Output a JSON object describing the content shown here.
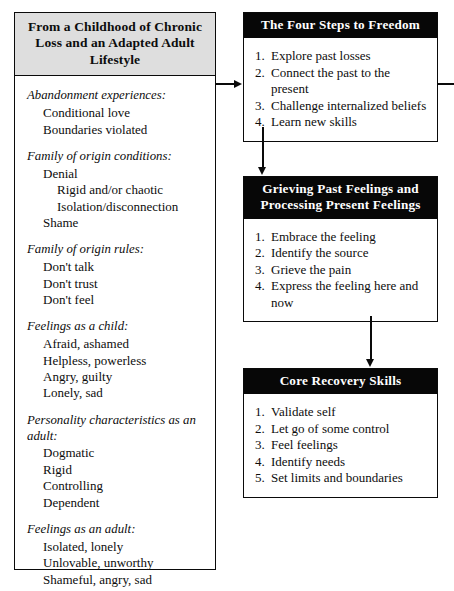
{
  "left_column": {
    "header": "From a Childhood of Chronic Loss and an Adapted Adult Lifestyle",
    "groups": [
      {
        "title": "Abandonment experiences:",
        "items": [
          {
            "text": "Conditional love",
            "level": 1
          },
          {
            "text": "Boundaries violated",
            "level": 1
          }
        ]
      },
      {
        "title": "Family of origin conditions:",
        "items": [
          {
            "text": "Denial",
            "level": 1
          },
          {
            "text": "Rigid and/or chaotic",
            "level": 2
          },
          {
            "text": "Isolation/disconnection",
            "level": 2
          },
          {
            "text": "Shame",
            "level": 1
          }
        ]
      },
      {
        "title": "Family of origin rules:",
        "items": [
          {
            "text": "Don't talk",
            "level": 1
          },
          {
            "text": "Don't trust",
            "level": 1
          },
          {
            "text": "Don't feel",
            "level": 1
          }
        ]
      },
      {
        "title": "Feelings as a child:",
        "items": [
          {
            "text": "Afraid, ashamed",
            "level": 1
          },
          {
            "text": "Helpless, powerless",
            "level": 1
          },
          {
            "text": "Angry, guilty",
            "level": 1
          },
          {
            "text": "Lonely, sad",
            "level": 1
          }
        ]
      },
      {
        "title": "Personality characteristics as an adult:",
        "items": [
          {
            "text": "Dogmatic",
            "level": 1
          },
          {
            "text": "Rigid",
            "level": 1
          },
          {
            "text": "Controlling",
            "level": 1
          },
          {
            "text": "Dependent",
            "level": 1
          }
        ]
      },
      {
        "title": "Feelings as an adult:",
        "items": [
          {
            "text": "Isolated, lonely",
            "level": 1
          },
          {
            "text": "Unlovable, unworthy",
            "level": 1
          },
          {
            "text": "Shameful, angry, sad",
            "level": 1
          }
        ]
      }
    ]
  },
  "boxes": {
    "steps": {
      "header": "The Four Steps to Freedom",
      "items": [
        {
          "num": "1.",
          "text": "Explore past losses"
        },
        {
          "num": "2.",
          "text": "Connect the past to the present"
        },
        {
          "num": "3.",
          "text": "Challenge internalized beliefs"
        },
        {
          "num": "4.",
          "text": "Learn new skills"
        }
      ]
    },
    "grieving": {
      "header": "Grieving Past Feelings and Processing Present Feelings",
      "items": [
        {
          "num": "1.",
          "text": "Embrace the feeling"
        },
        {
          "num": "2.",
          "text": "Identify the source"
        },
        {
          "num": "3.",
          "text": "Grieve the pain"
        },
        {
          "num": "4.",
          "text": "Express the feeling here and now"
        }
      ]
    },
    "core": {
      "header": "Core Recovery Skills",
      "items": [
        {
          "num": "1.",
          "text": "Validate self"
        },
        {
          "num": "2.",
          "text": "Let go of some control"
        },
        {
          "num": "3.",
          "text": "Feel feelings"
        },
        {
          "num": "4.",
          "text": "Identify needs"
        },
        {
          "num": "5.",
          "text": "Set limits and boundaries"
        }
      ]
    }
  },
  "colors": {
    "header_fill": "#dedede",
    "box_header_fill": "#070707",
    "line": "#0a0a0a"
  }
}
